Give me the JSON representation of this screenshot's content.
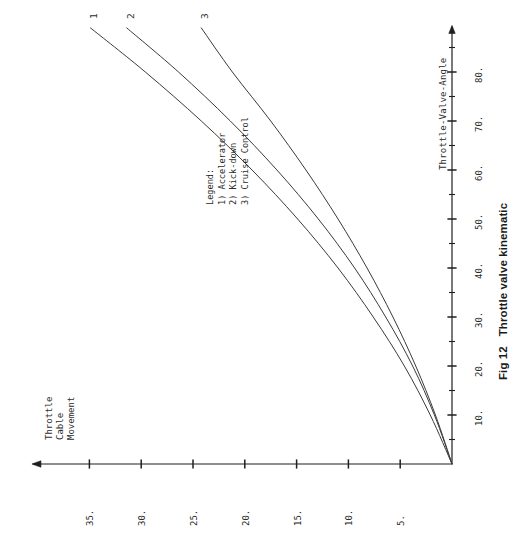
{
  "figure": {
    "caption": "Fig 12   Throttle valve kinematic",
    "orientation": "rotated-90-ccw"
  },
  "axes": {
    "vertical_axis": {
      "title": "Throttle-Valve-Angle",
      "unit_label_suffix": ".",
      "ticks": [
        10,
        20,
        30,
        40,
        50,
        60,
        70,
        80
      ],
      "tick_labels": [
        "10.",
        "20.",
        "30.",
        "40.",
        "50.",
        "60.",
        "70.",
        "80."
      ],
      "minor_step": 5,
      "range": [
        0,
        89
      ],
      "direction": "up"
    },
    "horizontal_axis": {
      "title": "Throttle\nCable\nMovement",
      "title_lines": [
        "Throttle",
        "Cable",
        "Movement"
      ],
      "ticks": [
        5,
        10,
        15,
        20,
        25,
        30,
        35
      ],
      "tick_labels": [
        "5.",
        "10.",
        "15.",
        "20.",
        "25.",
        "30.",
        "35."
      ],
      "minor_step": 5,
      "range": [
        0,
        40
      ],
      "direction": "left"
    }
  },
  "legend": {
    "heading": "Legend:",
    "entries": [
      "1) Accelerator",
      "2) Kick-down",
      "3) Cruise Control"
    ]
  },
  "curve_labels": [
    "1",
    "2",
    "3"
  ],
  "colors": {
    "ink": "#2b2b2b",
    "axis": "#1f1f1f",
    "curve": "#3a3a3a",
    "background": "#ffffff"
  },
  "chart_data": {
    "type": "line",
    "title": "Fig 12   Throttle valve kinematic",
    "xlabel": "Throttle-Valve-Angle",
    "ylabel": "Throttle Cable Movement",
    "xlim": [
      0,
      89
    ],
    "ylim": [
      0,
      40
    ],
    "grid": false,
    "legend_position": "inside-center",
    "x": [
      0,
      10,
      20,
      30,
      40,
      50,
      60,
      70,
      80,
      89
    ],
    "series": [
      {
        "name": "1) Accelerator",
        "label": "1",
        "values": [
          0,
          2.1,
          4.6,
          7.6,
          11.0,
          14.9,
          19.3,
          24.2,
          29.6,
          34.9
        ]
      },
      {
        "name": "2) Kick-down",
        "label": "2",
        "values": [
          0,
          1.7,
          3.8,
          6.4,
          9.4,
          12.9,
          16.9,
          21.4,
          26.4,
          31.4
        ]
      },
      {
        "name": "3) Cruise Control",
        "label": "3",
        "values": [
          0,
          1.6,
          3.5,
          5.7,
          8.2,
          11.0,
          14.1,
          17.5,
          21.2,
          24.2
        ]
      }
    ]
  }
}
